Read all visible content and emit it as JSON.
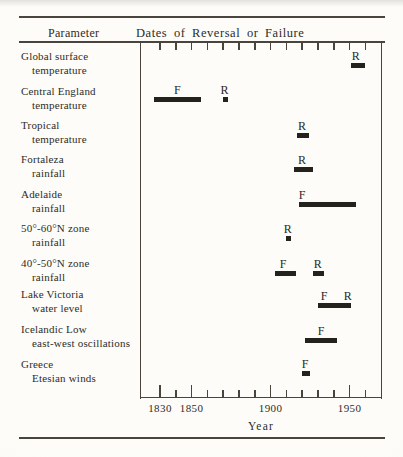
{
  "figure": {
    "background": "#fbfaf6",
    "ink": "#2e2c27",
    "bar_color": "#23221d",
    "line_color": "#49453d"
  },
  "header": {
    "parameter": "Parameter",
    "dates": "Dates of Reversal or Failure"
  },
  "chart_data": {
    "type": "bar",
    "title": "Dates of Reversal or Failure",
    "xlabel": "Year",
    "xlim": [
      1812,
      1970
    ],
    "grid": false,
    "x_ticks_major": [
      1830,
      1850,
      1900,
      1950
    ],
    "x_ticks_minor": [
      1840,
      1860,
      1870,
      1880,
      1890,
      1910,
      1920,
      1930,
      1940,
      1960
    ],
    "top_ticks": [
      1830,
      1840,
      1850,
      1860,
      1870,
      1880,
      1890,
      1900,
      1910,
      1920,
      1930,
      1940,
      1950,
      1960
    ],
    "rows": [
      {
        "parameter": "Global surface temperature",
        "label_lines": [
          "Global surface",
          "temperature"
        ],
        "marks": [
          {
            "start": 1951,
            "end": 1960,
            "labels": [
              {
                "text": "R",
                "year": 1954
              }
            ]
          }
        ]
      },
      {
        "parameter": "Central England temperature",
        "label_lines": [
          "Central England",
          "temperature"
        ],
        "marks": [
          {
            "start": 1826,
            "end": 1856,
            "labels": [
              {
                "text": "F",
                "year": 1841
              }
            ]
          },
          {
            "start": 1870,
            "end": 1873,
            "labels": [
              {
                "text": "R",
                "year": 1871
              }
            ]
          }
        ]
      },
      {
        "parameter": "Tropical temperature",
        "label_lines": [
          "Tropical",
          "temperature"
        ],
        "marks": [
          {
            "start": 1917,
            "end": 1924,
            "labels": [
              {
                "text": "R",
                "year": 1920
              }
            ]
          }
        ]
      },
      {
        "parameter": "Fortaleza rainfall",
        "label_lines": [
          "Fortaleza",
          "rainfall"
        ],
        "marks": [
          {
            "start": 1915,
            "end": 1927,
            "labels": [
              {
                "text": "R",
                "year": 1920
              }
            ]
          }
        ]
      },
      {
        "parameter": "Adelaide rainfall",
        "label_lines": [
          "Adelaide",
          "rainfall"
        ],
        "marks": [
          {
            "start": 1918,
            "end": 1954,
            "labels": [
              {
                "text": "F",
                "year": 1920
              }
            ]
          }
        ]
      },
      {
        "parameter": "50°-60°N zone rainfall",
        "label_lines": [
          "50°-60°N zone",
          "rainfall"
        ],
        "marks": [
          {
            "start": 1910,
            "end": 1913,
            "labels": [
              {
                "text": "R",
                "year": 1911
              }
            ]
          }
        ]
      },
      {
        "parameter": "40°-50°N zone rainfall",
        "label_lines": [
          "40°-50°N zone",
          "rainfall"
        ],
        "marks": [
          {
            "start": 1903,
            "end": 1916,
            "labels": [
              {
                "text": "F",
                "year": 1908
              }
            ]
          },
          {
            "start": 1927,
            "end": 1934,
            "labels": [
              {
                "text": "R",
                "year": 1930
              }
            ]
          }
        ]
      },
      {
        "parameter": "Lake Victoria water level",
        "label_lines": [
          "Lake Victoria",
          "water level"
        ],
        "marks": [
          {
            "start": 1930,
            "end": 1951,
            "labels": [
              {
                "text": "F",
                "year": 1934
              },
              {
                "text": "R",
                "year": 1949
              }
            ]
          }
        ]
      },
      {
        "parameter": "Icelandic Low east-west oscillations",
        "label_lines": [
          "Icelandic Low",
          "east-west oscillations"
        ],
        "marks": [
          {
            "start": 1922,
            "end": 1942,
            "labels": [
              {
                "text": "F",
                "year": 1932
              }
            ]
          }
        ]
      },
      {
        "parameter": "Greece Etesian winds",
        "label_lines": [
          "Greece",
          "Etesian winds"
        ],
        "marks": [
          {
            "start": 1920,
            "end": 1925,
            "labels": [
              {
                "text": "F",
                "year": 1922
              }
            ]
          }
        ]
      }
    ]
  }
}
